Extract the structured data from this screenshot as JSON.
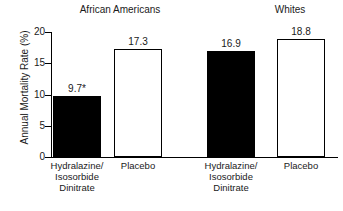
{
  "chart_data": {
    "type": "bar",
    "title": "",
    "xlabel": "",
    "ylabel": "Annual Mortality Rate (%)",
    "ylim": [
      0,
      20
    ],
    "yticks": [
      0,
      5,
      10,
      15,
      20
    ],
    "ytick_labels": [
      "0",
      "5",
      "10",
      "15",
      "20"
    ],
    "grid": false,
    "legend": false,
    "categories": [
      "Hydralazine/ Isosorbide Dinitrate",
      "Placebo",
      "Hydralazine/ Isosorbide Dinitrate",
      "Placebo"
    ],
    "values": [
      9.7,
      17.3,
      16.9,
      18.8
    ],
    "value_labels": [
      "9.7*",
      "17.3",
      "16.9",
      "18.8"
    ],
    "groups": [
      {
        "label": "African Americans",
        "bar_indices": [
          0,
          1
        ]
      },
      {
        "label": "Whites",
        "bar_indices": [
          2,
          3
        ]
      }
    ],
    "annotations": [
      "* asterisk on 9.7 denotes statistical significance"
    ],
    "colors": {
      "filled_bar": "#000000",
      "hollow_bar": "#ffffff",
      "outline": "#000000",
      "text": "#1a1a1a",
      "background": "#ffffff"
    },
    "bars": [
      {
        "value": 9.7,
        "value_label": "9.7*",
        "fill": "filled",
        "group": "African Americans",
        "category_lines": [
          "Hydralazine/",
          "Isosorbide",
          "Dinitrate"
        ]
      },
      {
        "value": 17.3,
        "value_label": "17.3",
        "fill": "hollow",
        "group": "African Americans",
        "category_lines": [
          "Placebo"
        ]
      },
      {
        "value": 16.9,
        "value_label": "16.9",
        "fill": "filled",
        "group": "Whites",
        "category_lines": [
          "Hydralazine/",
          "Isosorbide",
          "Dinitrate"
        ]
      },
      {
        "value": 18.8,
        "value_label": "18.8",
        "fill": "hollow",
        "group": "Whites",
        "category_lines": [
          "Placebo"
        ]
      }
    ]
  }
}
